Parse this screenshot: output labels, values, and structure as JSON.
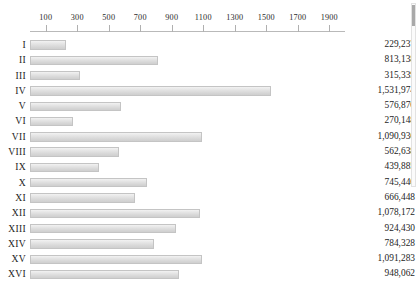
{
  "chart_data": {
    "type": "bar",
    "orientation": "horizontal",
    "title": "",
    "xlabel": "",
    "ylabel": "",
    "grid": false,
    "legend": null,
    "xlim": [
      0,
      2000
    ],
    "axis_position": "top",
    "tick_labels": [
      "100",
      "300",
      "500",
      "700",
      "900",
      "1100",
      "1300",
      "1500",
      "1700",
      "1900"
    ],
    "tick_values": [
      100,
      300,
      500,
      700,
      900,
      1100,
      1300,
      1500,
      1700,
      1900
    ],
    "value_scale_note": "bar lengths plotted in thousands",
    "categories": [
      "I",
      "II",
      "III",
      "IV",
      "V",
      "VI",
      "VII",
      "VIII",
      "IX",
      "X",
      "XI",
      "XII",
      "XIII",
      "XIV",
      "XV",
      "XVI"
    ],
    "values": [
      229237,
      813138,
      315339,
      1531974,
      576870,
      270148,
      1090936,
      562638,
      439885,
      745440,
      666448,
      1078172,
      924430,
      784328,
      1091283,
      948062
    ],
    "value_labels": [
      "229,237",
      "813,138",
      "315,339",
      "1,531,974",
      "576,870",
      "270,148",
      "1,090,936",
      "562,638",
      "439,885",
      "745,440",
      "666,448",
      "1,078,172",
      "924,430",
      "784,328",
      "1,091,283",
      "948,062"
    ],
    "colors": {
      "bar_fill_top": "#f2f2f2",
      "bar_fill_bottom": "#cfcfcf",
      "bar_border": "#c4c4c4",
      "axis": "#b9b9b9",
      "text": "#1d1d1d"
    }
  },
  "scrollbar": {
    "thumb_position": "top",
    "track_color": "#fbfbfb",
    "thumb_color": "#a9a9a9"
  }
}
